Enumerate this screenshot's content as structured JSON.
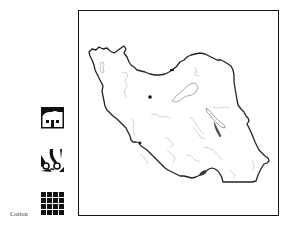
{
  "map": {
    "subject": "Iran",
    "frame_border_color": "#111111",
    "outline_color": "#222222",
    "river_color": "#b0b0b0",
    "city_marker": {
      "color": "#111111"
    }
  },
  "legend": {
    "items": [
      {
        "icon": "house-icon",
        "label": ""
      },
      {
        "icon": "shears-icon",
        "label": ""
      },
      {
        "icon": "grid-icon",
        "label": "Cotton"
      }
    ]
  }
}
